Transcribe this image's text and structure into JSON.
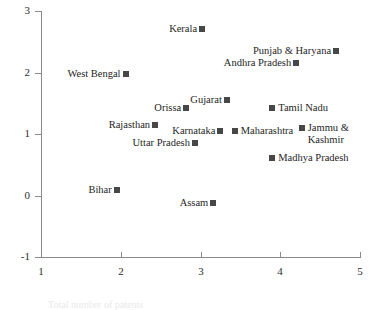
{
  "chart_data": {
    "type": "scatter",
    "title": "",
    "xlabel": "",
    "ylabel": "",
    "xlim": [
      1,
      5
    ],
    "ylim": [
      -1,
      3
    ],
    "xticks": [
      "1",
      "2",
      "3",
      "4",
      "5"
    ],
    "yticks": [
      "3",
      "2",
      "1",
      "0",
      "-1"
    ],
    "grid": false,
    "legend": "none",
    "marker": "filled-square",
    "marker_color": "#474747",
    "axis_color": "#8a8a8a",
    "points": [
      {
        "label": "Kerala",
        "x": 3.02,
        "y": 2.7,
        "label_side": "left"
      },
      {
        "label": "Punjab & Haryana",
        "x": 4.7,
        "y": 2.35,
        "label_side": "left"
      },
      {
        "label": "Andhra Pradesh",
        "x": 4.2,
        "y": 2.15,
        "label_side": "left"
      },
      {
        "label": "West Bengal",
        "x": 2.06,
        "y": 1.97,
        "label_side": "left"
      },
      {
        "label": "Gujarat",
        "x": 3.33,
        "y": 1.56,
        "label_side": "left"
      },
      {
        "label": "Orissa",
        "x": 2.82,
        "y": 1.43,
        "label_side": "left"
      },
      {
        "label": "Tamil Nadu",
        "x": 3.9,
        "y": 1.43,
        "label_side": "right"
      },
      {
        "label": "Rajasthan",
        "x": 2.43,
        "y": 1.15,
        "label_side": "left"
      },
      {
        "label": "Jammu & Kashmir",
        "x": 4.27,
        "y": 1.09,
        "label_side": "right"
      },
      {
        "label": "Karnataka",
        "x": 3.25,
        "y": 1.05,
        "label_side": "left"
      },
      {
        "label": "Maharashtra",
        "x": 3.43,
        "y": 1.05,
        "label_side": "right"
      },
      {
        "label": "Uttar Pradesh",
        "x": 2.93,
        "y": 0.86,
        "label_side": "left"
      },
      {
        "label": "Madhya Pradesh",
        "x": 3.9,
        "y": 0.61,
        "label_side": "right"
      },
      {
        "label": "Bihar",
        "x": 1.95,
        "y": 0.09,
        "label_side": "left"
      },
      {
        "label": "Assam",
        "x": 3.16,
        "y": -0.12,
        "label_side": "left"
      }
    ]
  },
  "footer": {
    "ghost_text": "Total number of patents"
  }
}
